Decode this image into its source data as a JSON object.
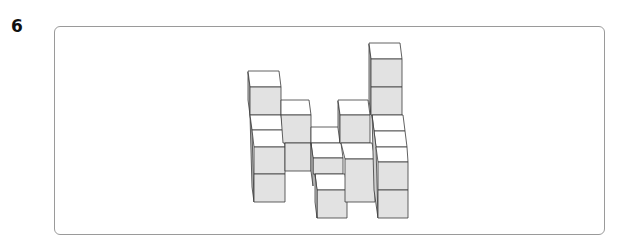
{
  "question": {
    "number": "6"
  },
  "figure": {
    "colors": {
      "top_face": "#ffffff",
      "front_face": "#e2e2e2",
      "side_face": "#cfcfcf",
      "edge": "#3a3a3a",
      "frame_border": "#9a9a9a"
    }
  }
}
